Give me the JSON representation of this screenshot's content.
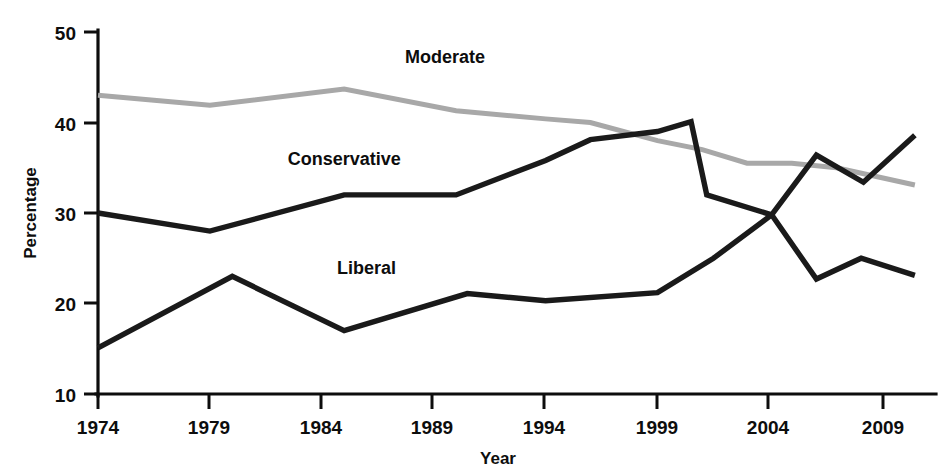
{
  "chart_data": {
    "type": "line",
    "title": "",
    "xlabel": "Year",
    "ylabel": "Percentage",
    "xlim": [
      1974,
      2010.5
    ],
    "ylim": [
      10,
      50
    ],
    "xticks": [
      1974,
      1979,
      1984,
      1989,
      1994,
      1999,
      2004,
      2009
    ],
    "xticklabels": [
      "1974",
      "1979",
      "1984",
      "1989",
      "1994",
      "1999",
      "2004",
      "2009"
    ],
    "yticks": [
      10,
      20,
      30,
      40,
      50
    ],
    "yticklabels": [
      "10",
      "20",
      "30",
      "40",
      "50"
    ],
    "grid": false,
    "legend_position": "inline-labels",
    "series": [
      {
        "name": "Moderate",
        "color": "#a8a8a8",
        "stroke_width": 5.0,
        "label_x": 1989.5,
        "label_y": 46.6,
        "x": [
          1974,
          1979,
          1985,
          1990,
          1994,
          1996,
          1999,
          2001,
          2003,
          2005,
          2007,
          2010.5
        ],
        "y": [
          43.0,
          41.9,
          43.7,
          41.3,
          40.4,
          40.0,
          38.0,
          37.0,
          35.5,
          35.5,
          35.0,
          33.1
        ]
      },
      {
        "name": "Conservative",
        "color": "#1a1a1a",
        "stroke_width": 5.4,
        "label_x": 1985.0,
        "label_y": 35.3,
        "x": [
          1974,
          1979,
          1985,
          1990,
          1994,
          1996,
          1999,
          2000.5,
          2001.2,
          2004.1,
          2006.1,
          2008.1,
          2010.5
        ],
        "y": [
          30.0,
          28.0,
          32.0,
          32.0,
          35.8,
          38.1,
          39.0,
          40.1,
          32.0,
          29.8,
          22.7,
          25.0,
          23.1
        ]
      },
      {
        "name": "Liberal",
        "color": "#1a1a1a",
        "stroke_width": 5.4,
        "label_x": 1986.0,
        "label_y": 23.3,
        "x": [
          1974,
          1980,
          1985,
          1990.5,
          1994,
          1999,
          2001.5,
          2004.1,
          2006.1,
          2008.2,
          2010.5
        ],
        "y": [
          15.1,
          23.0,
          17.0,
          21.1,
          20.3,
          21.2,
          25.0,
          29.8,
          36.4,
          33.4,
          38.6
        ]
      }
    ]
  },
  "axis": {
    "y_title": "Percentage",
    "x_title": "Year"
  }
}
